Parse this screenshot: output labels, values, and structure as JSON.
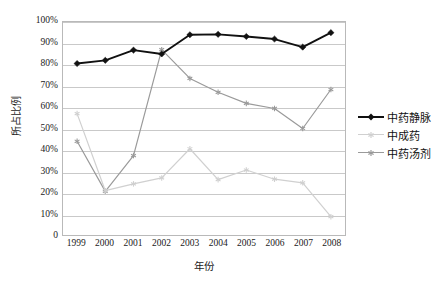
{
  "chart_data": {
    "type": "line",
    "title": "",
    "xlabel": "年份",
    "ylabel": "所占比例",
    "x": [
      "1999",
      "2000",
      "2001",
      "2002",
      "2003",
      "2004",
      "2005",
      "2006",
      "2007",
      "2008"
    ],
    "categories": [
      "1999",
      "2000",
      "2001",
      "2002",
      "2003",
      "2004",
      "2005",
      "2006",
      "2007",
      "2008"
    ],
    "ylim": [
      0,
      100
    ],
    "ytick_labels": [
      "100%",
      "90%",
      "80%",
      "70%",
      "60%",
      "50%",
      "40%",
      "30%",
      "20%",
      "10%",
      "0"
    ],
    "ytick_values": [
      100,
      90,
      80,
      70,
      60,
      50,
      40,
      30,
      20,
      10,
      0
    ],
    "grid": true,
    "legend_position": "right",
    "series": [
      {
        "name": "中药静脉",
        "color": "#111111",
        "marker": "diamond",
        "values": [
          80.5,
          82.0,
          86.8,
          85.0,
          94.0,
          94.2,
          93.2,
          92.0,
          88.2,
          95.0
        ]
      },
      {
        "name": "中成药",
        "color": "#d0d0d0",
        "marker": "star",
        "values": [
          57.0,
          20.8,
          24.0,
          26.8,
          40.5,
          26.0,
          30.5,
          26.2,
          24.5,
          8.6
        ]
      },
      {
        "name": "中药汤剂",
        "color": "#9a9a9a",
        "marker": "star",
        "values": [
          44.0,
          20.5,
          37.3,
          87.0,
          73.5,
          67.0,
          61.8,
          59.4,
          50.0,
          68.3
        ]
      }
    ]
  },
  "legend": {
    "items": [
      {
        "label": "中药静脉"
      },
      {
        "label": "中成药"
      },
      {
        "label": "中药汤剂"
      }
    ]
  },
  "axes": {
    "y_title": "所占比例",
    "x_title": "年份"
  }
}
